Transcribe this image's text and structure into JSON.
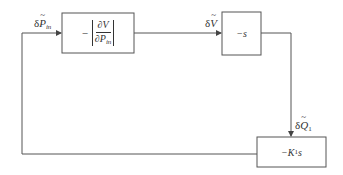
{
  "diagram": {
    "type": "block-diagram",
    "blocks": [
      {
        "id": "block1",
        "minus": "−",
        "num": "∂V",
        "den_main": "∂P",
        "den_sub": "in"
      },
      {
        "id": "block2",
        "label": "−s"
      },
      {
        "id": "block3",
        "label_prefix": "−K",
        "label_sub": "1",
        "label_suffix": "s"
      }
    ],
    "signals": {
      "p_in": {
        "delta": "δ",
        "symbol": "P",
        "sub": "in"
      },
      "v": {
        "delta": "δ",
        "symbol": "V"
      },
      "q1": {
        "delta": "δ",
        "symbol": "Q",
        "sub": "1"
      }
    },
    "colors": {
      "line": "#555555",
      "text": "#333333",
      "background": "#ffffff"
    }
  }
}
